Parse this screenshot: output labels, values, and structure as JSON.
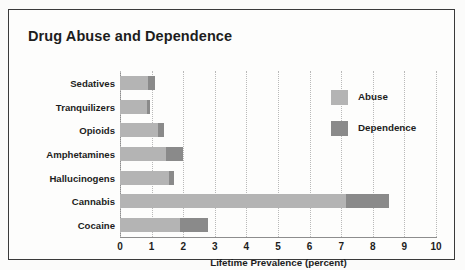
{
  "chart_data": {
    "type": "bar",
    "orientation": "horizontal",
    "stacked": true,
    "title": "Drug Abuse and Dependence",
    "xlabel": "Lifetime Prevalence (percent)",
    "ylabel": "",
    "xlim": [
      0,
      10
    ],
    "xticks": [
      "0",
      "1",
      "2",
      "3",
      "4",
      "5",
      "6",
      "7",
      "8",
      "9",
      "10"
    ],
    "grid": "vertical-dotted",
    "legend_position": "upper-right-inside",
    "categories": [
      "Sedatives",
      "Tranquilizers",
      "Opioids",
      "Amphetamines",
      "Hallucinogens",
      "Cannabis",
      "Cocaine"
    ],
    "series": [
      {
        "name": "Abuse",
        "color": "#b4b4b4",
        "values": [
          0.9,
          0.85,
          1.2,
          1.45,
          1.55,
          7.15,
          1.9
        ]
      },
      {
        "name": "Dependence",
        "color": "#8a8a8a",
        "values": [
          0.2,
          0.1,
          0.2,
          0.55,
          0.15,
          1.35,
          0.9
        ]
      }
    ],
    "totals": [
      1.1,
      0.95,
      1.4,
      2.0,
      1.7,
      8.5,
      2.8
    ]
  },
  "legend": {
    "items": [
      {
        "label": "Abuse",
        "color": "#b4b4b4"
      },
      {
        "label": "Dependence",
        "color": "#8a8a8a"
      }
    ]
  }
}
